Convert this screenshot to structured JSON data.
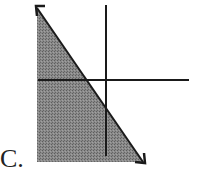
{
  "option_label": "C.",
  "diagram": {
    "type": "graph-region",
    "colors": {
      "shading": "#7a7a7a",
      "lines": "#1a1a1a",
      "background": "#ffffff"
    }
  }
}
